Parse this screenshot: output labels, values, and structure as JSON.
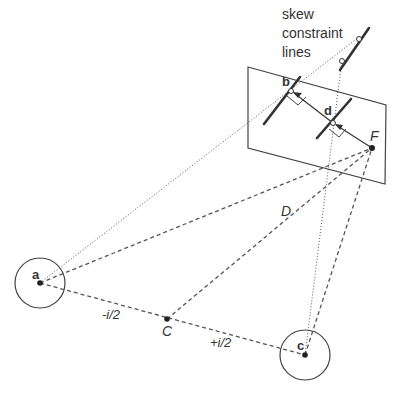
{
  "caption": {
    "line1": "skew",
    "line2": "constraint",
    "line3": "lines"
  },
  "points": {
    "a": "a",
    "b": "b",
    "c": "c",
    "d": "d",
    "F": "F",
    "C": "C",
    "D": "D"
  },
  "segments": {
    "minus_half": "-i/2",
    "plus_half": "+i/2"
  },
  "colors": {
    "stroke": "#444444",
    "text": "#333333",
    "background": "#ffffff"
  }
}
